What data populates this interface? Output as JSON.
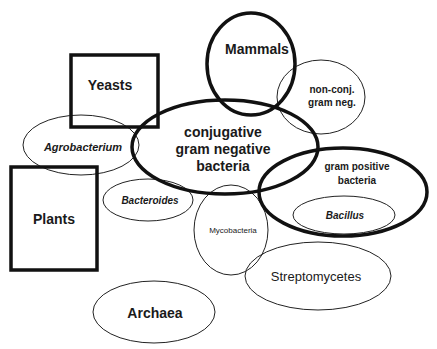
{
  "diagram": {
    "type": "venn-like",
    "colors": {
      "background": "#ffffff",
      "stroke": "#111111",
      "text": "#1a1a1a"
    },
    "shapes": {
      "yeasts": {
        "kind": "rect",
        "label": "Yeasts"
      },
      "plants": {
        "kind": "rect",
        "label": "Plants"
      },
      "mammals": {
        "kind": "ellipse",
        "label": "Mammals"
      },
      "nonconj": {
        "kind": "ellipse",
        "line1": "non-conj.",
        "line2": "gram neg."
      },
      "conjugative": {
        "kind": "ellipse",
        "line1": "conjugative",
        "line2": "gram negative",
        "line3": "bacteria"
      },
      "grampositive": {
        "kind": "ellipse",
        "line1": "gram positive",
        "line2": "bacteria"
      },
      "agrobacterium": {
        "kind": "ellipse",
        "label": "Agrobacterium"
      },
      "bacteroides": {
        "kind": "ellipse",
        "label": "Bacteroides"
      },
      "mycobacteria": {
        "kind": "ellipse",
        "label": "Mycobacteria"
      },
      "bacillus": {
        "kind": "ellipse",
        "label": "Bacillus"
      },
      "streptomycetes": {
        "kind": "ellipse",
        "label": "Streptomycetes"
      },
      "archaea": {
        "kind": "ellipse",
        "label": "Archaea"
      }
    }
  }
}
